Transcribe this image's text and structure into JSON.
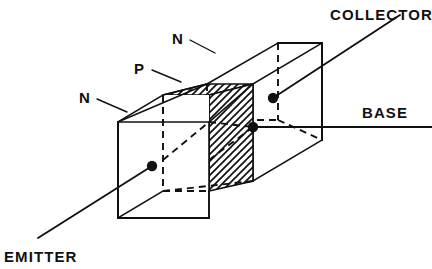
{
  "figure": {
    "kind": "npn-transistor-block-diagram",
    "background_color": "#ffffff",
    "line_color": "#111111"
  },
  "terminals": [
    {
      "id": "collector",
      "label": "COLLECTOR"
    },
    {
      "id": "base",
      "label": "BASE"
    },
    {
      "id": "emitter",
      "label": "EMITTER"
    }
  ],
  "regions": [
    {
      "id": "region-n-collector",
      "label": "N",
      "fill": "white"
    },
    {
      "id": "region-p-base",
      "label": "P",
      "fill": "stipple-hatch"
    },
    {
      "id": "region-n-emitter",
      "label": "N",
      "fill": "white"
    }
  ],
  "labels": {
    "collector": "COLLECTOR",
    "base": "BASE",
    "emitter": "EMITTER",
    "n_top": "N",
    "p_middle": "P",
    "n_left": "N"
  }
}
